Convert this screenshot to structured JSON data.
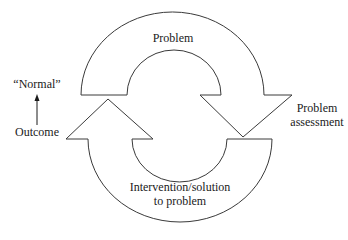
{
  "diagram": {
    "type": "cycle",
    "stroke_color": "#3a3a3a",
    "fill_color": "#ffffff",
    "nodes": {
      "top_arrow": {
        "label": "Problem"
      },
      "right_label": {
        "line1": "Problem",
        "line2": "assessment"
      },
      "bottom_arrow": {
        "line1": "Intervention/solution",
        "line2": "to problem"
      },
      "left_outcome": {
        "label": "Outcome"
      },
      "left_normal": {
        "label": "“Normal”"
      }
    },
    "edges": [
      {
        "from": "Problem",
        "to": "Problem assessment",
        "shape": "curved-arrow-clockwise-top"
      },
      {
        "from": "Intervention/solution to problem",
        "to": "Outcome",
        "shape": "curved-arrow-clockwise-bottom"
      },
      {
        "from": "Outcome",
        "to": "“Normal”",
        "shape": "straight-arrow-up"
      }
    ]
  }
}
